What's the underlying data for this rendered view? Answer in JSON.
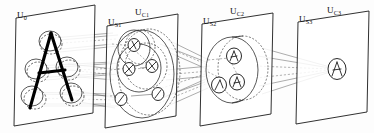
{
  "figure": {
    "width": 374,
    "height": 133,
    "background_color": "#fdfdfd",
    "ink_color": "#111111"
  },
  "labels": [
    {
      "id": "u0",
      "base": "U",
      "sub": "0",
      "text": "U0",
      "x": 17,
      "y": 11
    },
    {
      "id": "us1",
      "base": "U",
      "sub": "S1",
      "text": "US1",
      "x": 108,
      "y": 18
    },
    {
      "id": "uc1",
      "base": "U",
      "sub": "C1",
      "text": "UC1",
      "x": 135,
      "y": 8
    },
    {
      "id": "us2",
      "base": "U",
      "sub": "S2",
      "text": "US2",
      "x": 203,
      "y": 17
    },
    {
      "id": "uc2",
      "base": "U",
      "sub": "C2",
      "text": "UC2",
      "x": 230,
      "y": 7
    },
    {
      "id": "us3",
      "base": "U",
      "sub": "S3",
      "text": "US3",
      "x": 299,
      "y": 15
    },
    {
      "id": "uc3",
      "base": "U",
      "sub": "C3",
      "text": "UC3",
      "x": 327,
      "y": 6
    }
  ],
  "stages": [
    {
      "id": "stage-input",
      "name": "input-layer",
      "label_refs": [
        "u0"
      ],
      "stimulus": "A",
      "receptive_field_count": 5,
      "cell_count": 0
    },
    {
      "id": "stage-1",
      "name": "first-feature-stage",
      "label_refs": [
        "us1",
        "uc1"
      ],
      "cell_count": 5,
      "glyph_kinds": [
        "diagonal-right",
        "diagonal-left",
        "vertex",
        "horizontal",
        "slant"
      ]
    },
    {
      "id": "stage-2",
      "name": "second-feature-stage",
      "label_refs": [
        "us2",
        "uc2"
      ],
      "cell_count": 3,
      "glyph_kinds": [
        "a-fragment-top",
        "a-fragment-left",
        "a-fragment-right"
      ]
    },
    {
      "id": "stage-3",
      "name": "output-recognition-stage",
      "label_refs": [
        "us3",
        "uc3"
      ],
      "cell_count": 1,
      "glyph_kinds": [
        "letter-a-complete"
      ]
    }
  ],
  "planes": [
    {
      "id": "plane-0",
      "name": "plane-u0",
      "top_left_x": 16,
      "top_y": 18,
      "bottom_left_x": 14,
      "bottom_y": 126,
      "top_right_x": 95,
      "top_right_y": 5,
      "bottom_right_x": 93,
      "bottom_right_y": 113
    },
    {
      "id": "plane-1",
      "name": "plane-uc1",
      "top_left_x": 107,
      "top_y": 26,
      "bottom_left_x": 105,
      "bottom_y": 128,
      "top_right_x": 178,
      "top_right_y": 14,
      "bottom_right_x": 176,
      "bottom_right_y": 116
    },
    {
      "id": "plane-2",
      "name": "plane-uc2",
      "top_left_x": 202,
      "top_y": 24,
      "bottom_left_x": 200,
      "bottom_y": 126,
      "top_right_x": 273,
      "top_right_y": 13,
      "bottom_right_x": 271,
      "bottom_right_y": 114
    },
    {
      "id": "plane-3",
      "name": "plane-uc3",
      "top_left_x": 298,
      "top_y": 22,
      "bottom_left_x": 296,
      "bottom_y": 124,
      "top_right_x": 369,
      "top_right_y": 11,
      "bottom_right_x": 367,
      "bottom_right_y": 112
    }
  ],
  "connection_bundles": [
    {
      "id": "bundle-0-1",
      "name": "connections-u0-to-us1",
      "style": "converging-tubes",
      "line_count": 8
    },
    {
      "id": "bundle-1-2",
      "name": "connections-uc1-to-us2",
      "style": "converging-tubes",
      "line_count": 7
    },
    {
      "id": "bundle-2-3",
      "name": "connections-uc2-to-us3",
      "style": "converging-cone",
      "line_count": 5
    }
  ]
}
